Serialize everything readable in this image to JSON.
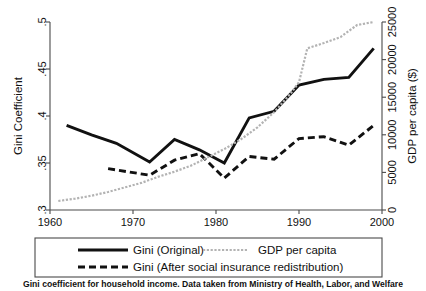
{
  "chart_data": {
    "type": "line",
    "title": "",
    "caption": "Gini coefficient for household income.  Data taken from Ministry of Health, Labor, and Welfare",
    "grid": false,
    "legend_position": "below-plot",
    "xlabel": "",
    "xlim": [
      1960,
      2000
    ],
    "xticks": [
      1960,
      1970,
      1980,
      1990,
      2000
    ],
    "xtick_labels": [
      "1960",
      "1970",
      "1980",
      "1990",
      "2000"
    ],
    "y_left": {
      "label": "Gini Coefficient",
      "lim": [
        0.3,
        0.5
      ],
      "ticks": [
        0.3,
        0.35,
        0.4,
        0.45,
        0.5
      ],
      "tick_labels": [
        ".3",
        ".35",
        ".4",
        ".45",
        ".5"
      ]
    },
    "y_right": {
      "label": "GDP per capita ($)",
      "lim": [
        0,
        25000
      ],
      "ticks": [
        0,
        5000,
        10000,
        15000,
        20000,
        25000
      ],
      "tick_labels": [
        "0",
        "5000",
        "10000",
        "15000",
        "20000",
        "25000"
      ]
    },
    "series": [
      {
        "name": "Gini (Original)",
        "axis": "left",
        "style": "solid",
        "color": "#111111",
        "x": [
          1962,
          1965,
          1968,
          1972,
          1975,
          1978,
          1981,
          1984,
          1987,
          1990,
          1993,
          1996,
          1999
        ],
        "values": [
          0.39,
          0.38,
          0.371,
          0.351,
          0.375,
          0.364,
          0.35,
          0.398,
          0.405,
          0.433,
          0.439,
          0.441,
          0.472
        ]
      },
      {
        "name": "Gini (After social insurance redistribution)",
        "axis": "left",
        "style": "dashed",
        "color": "#111111",
        "x": [
          1967,
          1972,
          1975,
          1978,
          1981,
          1984,
          1987,
          1990,
          1993,
          1996,
          1999
        ],
        "values": [
          0.344,
          0.337,
          0.353,
          0.36,
          0.334,
          0.357,
          0.354,
          0.376,
          0.378,
          0.369,
          0.39
        ]
      },
      {
        "name": "GDP per capita",
        "axis": "right",
        "style": "dotted",
        "color": "#b3b3b3",
        "x": [
          1961,
          1963,
          1965,
          1967,
          1969,
          1971,
          1973,
          1975,
          1977,
          1979,
          1981,
          1983,
          1985,
          1987,
          1989,
          1990,
          1991,
          1993,
          1995,
          1997,
          1999
        ],
        "values": [
          1200,
          1500,
          1900,
          2400,
          3000,
          3600,
          4400,
          5100,
          5900,
          7000,
          8100,
          9400,
          11000,
          13000,
          15500,
          17000,
          21500,
          22200,
          23000,
          24600,
          25000
        ]
      }
    ]
  },
  "legend": {
    "entries": [
      {
        "label": "Gini (Original)",
        "style": "solid"
      },
      {
        "label": "GDP per capita",
        "style": "dotted"
      },
      {
        "label": "Gini (After social insurance redistribution)",
        "style": "dashed"
      }
    ]
  }
}
